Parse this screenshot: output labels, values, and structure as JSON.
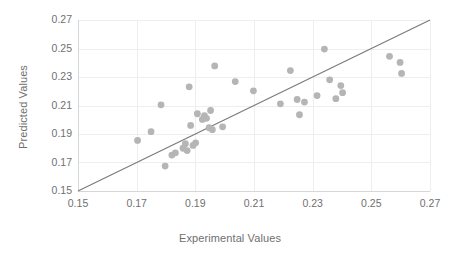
{
  "chart_data": {
    "type": "scatter",
    "title": "",
    "xlabel": "Experimental Values",
    "ylabel": "Predicted Values",
    "xlim": [
      0.15,
      0.27
    ],
    "ylim": [
      0.15,
      0.27
    ],
    "xticks": [
      0.15,
      0.17,
      0.19,
      0.21,
      0.23,
      0.25,
      0.27
    ],
    "yticks": [
      0.15,
      0.17,
      0.19,
      0.21,
      0.23,
      0.25,
      0.27
    ],
    "xtick_labels": [
      "0.15",
      "0.17",
      "0.19",
      "0.21",
      "0.23",
      "0.25",
      "0.27"
    ],
    "ytick_labels": [
      "0.15",
      "0.17",
      "0.19",
      "0.21",
      "0.23",
      "0.25",
      "0.27"
    ],
    "grid": true,
    "legend": null,
    "marker_color": "#b5b5b5",
    "line_color": "#7a7a7a",
    "grid_color": "#eceff1",
    "text_color": "#6f6f6f",
    "reference_line": {
      "name": "parity-line",
      "from": [
        0.15,
        0.15
      ],
      "to": [
        0.27,
        0.27
      ],
      "slope": 1,
      "intercept": 0
    },
    "series": [
      {
        "name": "Predicted vs Experimental",
        "x": [
          0.1703,
          0.1749,
          0.1783,
          0.1797,
          0.182,
          0.1832,
          0.1858,
          0.1866,
          0.1872,
          0.1879,
          0.1884,
          0.1892,
          0.1901,
          0.1907,
          0.1924,
          0.1931,
          0.1938,
          0.1947,
          0.1952,
          0.1958,
          0.1966,
          0.1993,
          0.2036,
          0.2098,
          0.219,
          0.2224,
          0.2247,
          0.2255,
          0.2272,
          0.2315,
          0.234,
          0.2358,
          0.2379,
          0.2396,
          0.2402,
          0.2562,
          0.2598,
          0.2603
        ],
        "y": [
          0.1855,
          0.1916,
          0.2105,
          0.1675,
          0.1752,
          0.1768,
          0.18,
          0.1832,
          0.1784,
          0.2231,
          0.196,
          0.182,
          0.1838,
          0.2042,
          0.2002,
          0.2028,
          0.201,
          0.1944,
          0.2065,
          0.193,
          0.2378,
          0.195,
          0.2268,
          0.2203,
          0.2112,
          0.2345,
          0.2142,
          0.2035,
          0.2124,
          0.217,
          0.2496,
          0.228,
          0.2148,
          0.224,
          0.219,
          0.2445,
          0.2402,
          0.2325
        ]
      }
    ]
  },
  "axes": {
    "x_title": "Experimental Values",
    "y_title": "Predicted Values"
  }
}
